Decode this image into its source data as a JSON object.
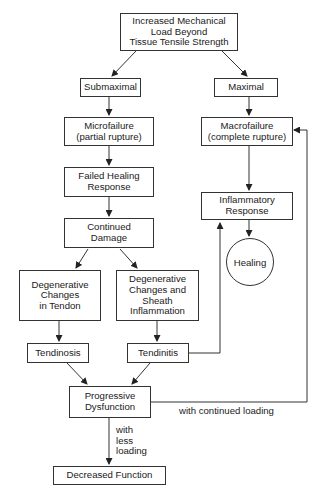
{
  "diagram": {
    "nodes": {
      "top": "Increased Mechanical\nLoad Beyond\nTissue Tensile Strength",
      "submaximal": "Submaximal",
      "maximal": "Maximal",
      "microfailure": "Microfailure\n(partial rupture)",
      "macrofailure": "Macrofailure\n(complete rupture)",
      "failed_healing": "Failed Healing\nResponse",
      "inflammatory": "Inflammatory\nResponse",
      "continued_damage": "Continued\nDamage",
      "healing": "Healing",
      "degen_tendon": "Degenerative\nChanges\nin Tendon",
      "degen_sheath": "Degenerative\nChanges and\nSheath\nInflammation",
      "tendinosis": "Tendinosis",
      "tendinitis": "Tendinitis",
      "progressive": "Progressive\nDysfunction",
      "decreased": "Decreased Function"
    },
    "edge_labels": {
      "continued_loading": "with continued loading",
      "less_loading": "with\nless\nloading"
    },
    "edges": [
      [
        "top",
        "submaximal"
      ],
      [
        "top",
        "maximal"
      ],
      [
        "submaximal",
        "microfailure"
      ],
      [
        "maximal",
        "macrofailure"
      ],
      [
        "microfailure",
        "failed_healing"
      ],
      [
        "failed_healing",
        "continued_damage"
      ],
      [
        "continued_damage",
        "degen_tendon"
      ],
      [
        "continued_damage",
        "degen_sheath"
      ],
      [
        "degen_tendon",
        "tendinosis"
      ],
      [
        "degen_sheath",
        "tendinitis"
      ],
      [
        "tendinosis",
        "progressive"
      ],
      [
        "tendinitis",
        "progressive"
      ],
      [
        "tendinitis",
        "inflammatory"
      ],
      [
        "macrofailure",
        "inflammatory"
      ],
      [
        "inflammatory",
        "healing"
      ],
      [
        "progressive",
        "macrofailure",
        "with continued loading"
      ],
      [
        "progressive",
        "decreased",
        "with less loading"
      ]
    ]
  }
}
